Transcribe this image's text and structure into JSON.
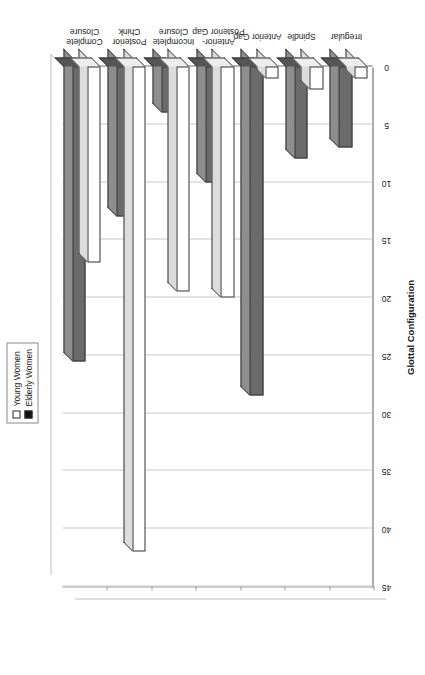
{
  "legend": {
    "position": "top",
    "items": [
      {
        "label": "Young Women",
        "swatch": "young",
        "color": "#ffffff"
      },
      {
        "label": "Elderly Women",
        "swatch": "elderly",
        "color": "#111111"
      }
    ]
  },
  "axes": {
    "value_axis_title": "Incidence (%)",
    "category_axis_title": "Glottal Configuration",
    "value_ticks": [
      "45",
      "40",
      "35",
      "30",
      "25",
      "20",
      "15",
      "10",
      "5",
      "0"
    ]
  },
  "chart_data": {
    "type": "bar",
    "title": "",
    "subtitle": "",
    "orientation": "vertical-rotated",
    "xlabel": "Glottal Configuration",
    "ylabel": "Incidence (%)",
    "ylim": [
      0,
      45
    ],
    "ytick_step": 5,
    "grid": true,
    "legend_position": "top",
    "categories": [
      "Complete Closure",
      "Posterior Chink",
      "Incomplete Closure",
      "Anterior-Posterior Gap",
      "Anterior Gap",
      "Spindle",
      "Irregular"
    ],
    "category_lines": [
      [
        "Complete",
        "Closure"
      ],
      [
        "Posterior",
        "Chink"
      ],
      [
        "Incomplete",
        "Closure"
      ],
      [
        "Anterior-",
        "Posterior Gap"
      ],
      [
        "Anterior Gap",
        ""
      ],
      [
        "Spindle",
        ""
      ],
      [
        "Irregular",
        ""
      ]
    ],
    "series": [
      {
        "name": "Young Women",
        "color": "#ffffff",
        "values": [
          17,
          42,
          19.5,
          20,
          1,
          2,
          1
        ]
      },
      {
        "name": "Elderly Women",
        "color": "#6b6b6b",
        "values": [
          25.5,
          13,
          4,
          10,
          28.5,
          8,
          7
        ]
      }
    ]
  }
}
